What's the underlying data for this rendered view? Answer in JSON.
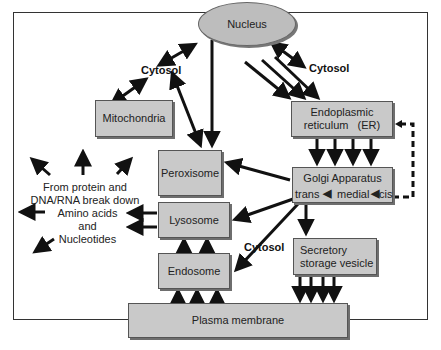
{
  "diagram": {
    "type": "cell organelle trafficking flow",
    "nodes": {
      "nucleus": "Nucleus",
      "mitochondria": "Mitochondria",
      "peroxisome": "Peroxisome",
      "er_line1": "Endoplasmic",
      "er_line2": "reticulum   (ER)",
      "golgi_title": "Golgi Apparatus",
      "golgi_trans": "trans",
      "golgi_medial": "medial",
      "golgi_cis": "cis",
      "lysosome": "Lysosome",
      "endosome": "Endosome",
      "secretory_line1": "Secretory",
      "secretory_line2": "storage vesicle",
      "plasma_membrane": "Plasma membrane"
    },
    "labels": {
      "cytosol_left": "Cytosol",
      "cytosol_right": "Cytosol",
      "cytosol_bottom": "Cytosol",
      "breakdown_line1": "From protein and",
      "breakdown_line2": "DNA/RNA break down",
      "products_line1": "Amino acids",
      "products_line2": "and",
      "products_line3": "Nucleotides"
    },
    "edges": [
      {
        "from": "Cytosol",
        "to": "Nucleus",
        "style": "double-arrow"
      },
      {
        "from": "Nucleus",
        "to": "Cytosol (right)",
        "style": "double-arrow"
      },
      {
        "from": "Cytosol",
        "to": "Mitochondria",
        "style": "double-arrow"
      },
      {
        "from": "Cytosol",
        "to": "Peroxisome",
        "style": "double-arrow"
      },
      {
        "from": "Nucleus",
        "to": "Peroxisome",
        "style": "arrow"
      },
      {
        "from": "Nucleus",
        "to": "Endoplasmic reticulum (ER)",
        "style": "arrow x3"
      },
      {
        "from": "Endoplasmic reticulum (ER)",
        "to": "Golgi Apparatus",
        "style": "arrow x4"
      },
      {
        "from": "Golgi Apparatus (cis)",
        "to": "Endoplasmic reticulum (ER)",
        "style": "dashed return"
      },
      {
        "from": "Golgi Apparatus",
        "to": "Peroxisome",
        "style": "arrow"
      },
      {
        "from": "Golgi Apparatus",
        "to": "Lysosome",
        "style": "arrow"
      },
      {
        "from": "Golgi Apparatus",
        "to": "Endosome",
        "style": "arrow"
      },
      {
        "from": "Golgi Apparatus",
        "to": "Secretory storage vesicle",
        "style": "arrow"
      },
      {
        "from": "Secretory storage vesicle",
        "to": "Plasma membrane",
        "style": "arrow x4"
      },
      {
        "from": "Plasma membrane",
        "to": "Endosome",
        "style": "arrow x3"
      },
      {
        "from": "Endosome",
        "to": "Lysosome",
        "style": "arrow x2"
      },
      {
        "from": "Lysosome",
        "to": "Amino acids and Nucleotides",
        "style": "arrow x2"
      },
      {
        "from": "Amino acids and Nucleotides",
        "to": "outward",
        "style": "arrow x5"
      }
    ],
    "colors": {
      "box_fill": "#c9c9c9",
      "box_border": "#555555",
      "arrow": "#111111",
      "frame": "#333333"
    }
  }
}
